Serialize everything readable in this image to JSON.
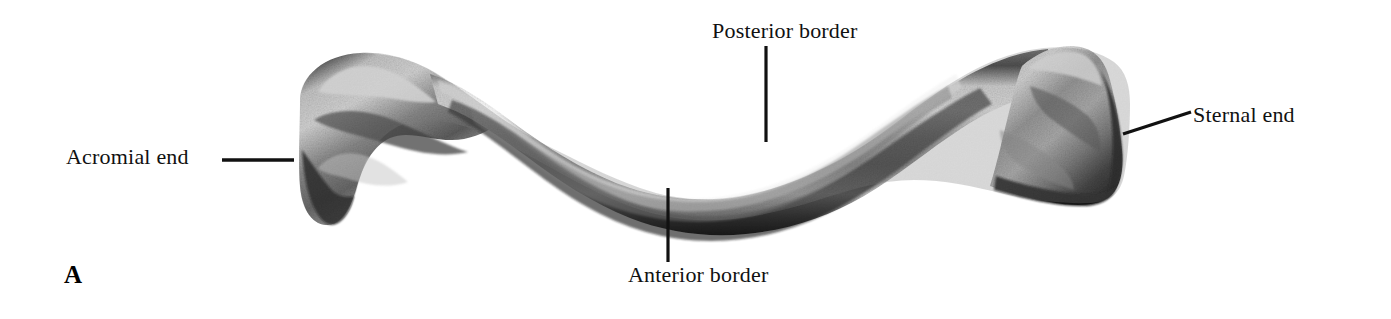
{
  "figure": {
    "panel_letter": "A",
    "background_color": "#ffffff",
    "ink_color": "#111111",
    "width": 1391,
    "height": 319
  },
  "labels": {
    "acromial_end": "Acromial end",
    "posterior_border": "Posterior border",
    "anterior_border": "Anterior border",
    "sternal_end": "Sternal end"
  },
  "leaders": {
    "acromial_end": {
      "x1": 222,
      "y1": 160,
      "x2": 294,
      "y2": 160
    },
    "posterior_border": {
      "x1": 766,
      "y1": 46,
      "x2": 766,
      "y2": 142
    },
    "anterior_border": {
      "x1": 668,
      "y1": 188,
      "x2": 668,
      "y2": 262
    },
    "sternal_end": {
      "x1": 1123,
      "y1": 134,
      "x2": 1191,
      "y2": 112
    }
  }
}
